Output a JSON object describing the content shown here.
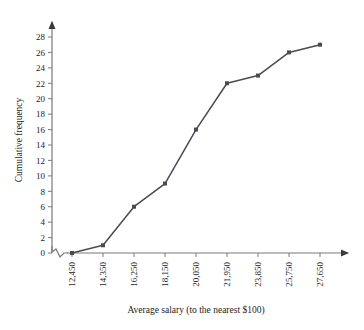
{
  "chart_data": {
    "type": "line",
    "title": "",
    "xlabel": "Average salary (to the nearest $100)",
    "ylabel": "Cumulative frequency",
    "categories": [
      "12,450",
      "14,350",
      "16,250",
      "18,150",
      "20,050",
      "21,950",
      "23,850",
      "25,750",
      "27,650"
    ],
    "x": [
      12450,
      14350,
      16250,
      18150,
      20050,
      21950,
      23850,
      25750,
      27650
    ],
    "values": [
      0,
      1,
      6,
      9,
      16,
      22,
      23,
      26,
      27
    ],
    "series": [
      {
        "name": "Cumulative frequency",
        "values": [
          0,
          1,
          6,
          9,
          16,
          22,
          23,
          26,
          27
        ]
      }
    ],
    "ylim": [
      0,
      29
    ],
    "ytick_labels": [
      "0",
      "2",
      "4",
      "6",
      "8",
      "10",
      "12",
      "14",
      "16",
      "18",
      "20",
      "22",
      "24",
      "26",
      "28"
    ],
    "ytick_values": [
      0,
      2,
      4,
      6,
      8,
      10,
      12,
      14,
      16,
      18,
      20,
      22,
      24,
      26,
      28
    ],
    "grid": false,
    "legend": "none",
    "marker": "square",
    "line_color": "#4a4a55",
    "axis_color": "#7a7a7a",
    "axis_break": "zigzag-on-x-axis-near-origin",
    "axis_arrows": [
      "x-right",
      "y-top"
    ]
  },
  "axes": {
    "x_title": "Average salary (to the nearest $100)",
    "y_title": "Cumulative frequency"
  }
}
